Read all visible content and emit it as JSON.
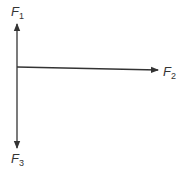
{
  "diagram": {
    "type": "force-vectors",
    "origin": {
      "x": 17,
      "y": 67
    },
    "stroke_color": "#333333",
    "vectors": [
      {
        "id": "F1",
        "symbol": "F",
        "subscript": "1",
        "direction": "up",
        "tip": {
          "x": 17,
          "y": 24
        }
      },
      {
        "id": "F2",
        "symbol": "F",
        "subscript": "2",
        "direction": "right",
        "tip": {
          "x": 158,
          "y": 70
        }
      },
      {
        "id": "F3",
        "symbol": "F",
        "subscript": "3",
        "direction": "down",
        "tip": {
          "x": 17,
          "y": 148
        }
      }
    ]
  }
}
